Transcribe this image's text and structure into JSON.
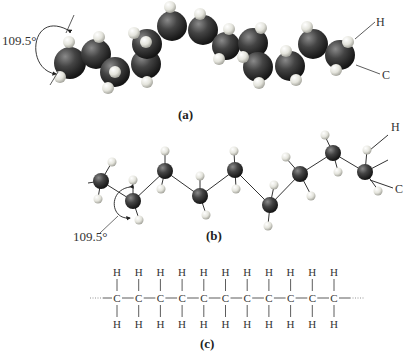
{
  "figure": {
    "panels": [
      {
        "id": "a",
        "caption": "(a)",
        "type": "space-filling model",
        "angle_label": "109.5°",
        "end_labels": {
          "top": "H",
          "bottom": "C"
        }
      },
      {
        "id": "b",
        "caption": "(b)",
        "type": "ball-and-stick model",
        "angle_label": "109.5°",
        "end_labels": {
          "top": "H",
          "bottom": "C"
        }
      },
      {
        "id": "c",
        "caption": "(c)",
        "type": "structural formula",
        "carbon_symbol": "C",
        "hydrogen_symbol": "H",
        "repeat_units": 11
      }
    ],
    "colors": {
      "carbon": "#3a3a3a",
      "hydrogen": "#e8e8e0",
      "bond": "#333333",
      "text": "#222222"
    }
  },
  "labels": {
    "a_angle": "109.5°",
    "a_H": "H",
    "a_C": "C",
    "a_caption": "(a)",
    "b_angle": "109.5°",
    "b_H": "H",
    "b_C": "C",
    "b_caption": "(b)",
    "c_caption": "(c)"
  }
}
